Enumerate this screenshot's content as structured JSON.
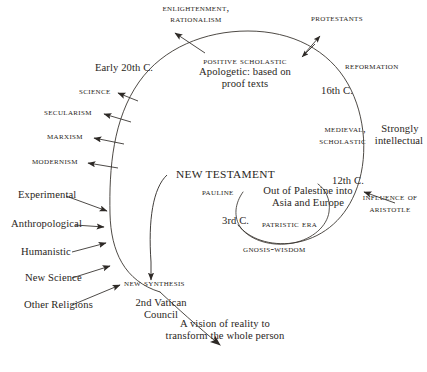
{
  "diagram": {
    "stroke_color": "#3a3530",
    "text_color": "#2a2622",
    "background": "#ffffff",
    "outer_labels": {
      "enlightenment": "Enlightenment,\nRationalism",
      "enlightenment_line1": "ENLIGHTENMENT,",
      "enlightenment_line2": "RATIONALISM",
      "protestants": "PROTESTANTS",
      "reformation": "REFORMATION",
      "strongly_intellectual_line1": "Strongly",
      "strongly_intellectual_line2": "intellectual",
      "influence_line1": "INFLUENCE OF",
      "influence_line2": "ARISTOTLE"
    },
    "era_markers": {
      "early_20th": "Early 20th C.",
      "sixteenth": "16th C.",
      "twelfth": "12th C.",
      "third": "3rd C."
    },
    "inner_labels": {
      "positive_scholastic": "POSITIVE SCHOLASTIC",
      "apologetic_line1": "Apologetic: based on",
      "apologetic_line2": "proof texts",
      "medieval_line1": "MEDIEVAL,",
      "medieval_line2": "SCHOLASTIC",
      "new_testament": "NEW TESTAMENT",
      "pauline": "PAULINE",
      "out_of_palestine_line1": "Out of Palestine into",
      "out_of_palestine_line2": "Asia and Europe",
      "patristic_era": "PATRISTIC ERA",
      "gnosis_wisdom": "GNOSIS-WISDOM"
    },
    "left_outflow_labels": [
      "SCIENCE",
      "SECULARISM",
      "MARXISM",
      "MODERNISM"
    ],
    "left_inflow_labels": [
      "Experimental",
      "Anthropological",
      "Humanistic",
      "New Science",
      "Other Religions"
    ],
    "bottom_labels": {
      "new_synthesis": "NEW SYNTHESIS",
      "vatican_line1": "2nd Vatican",
      "vatican_line2": "Council",
      "vision_line1": "A vision of reality to",
      "vision_line2": "transform the whole person"
    }
  }
}
